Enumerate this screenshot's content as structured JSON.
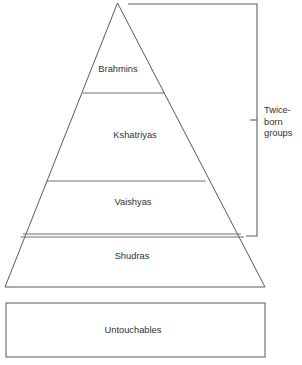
{
  "diagram": {
    "type": "pyramid-hierarchy",
    "title": "",
    "background_color": "#ffffff",
    "line_color": "#555a5e",
    "text_color": "#2f3234",
    "pyramid": {
      "name": "caste-pyramid",
      "apex": {
        "x": 117.5,
        "y": 3
      },
      "base_left": {
        "x": 5,
        "y": 287
      },
      "base_right": {
        "x": 265,
        "y": 287
      },
      "tiers": [
        {
          "id": "brahmins",
          "label": "Brahmins",
          "label_x": 118,
          "label_y": 70,
          "divider_y": 93,
          "divider_x1": 83,
          "divider_x2": 165
        },
        {
          "id": "kshatriyas",
          "label": "Kshatriyas",
          "label_x": 135,
          "label_y": 136,
          "divider_y": 181,
          "divider_x1": 46.5,
          "divider_x2": 205.5
        },
        {
          "id": "vaishyas",
          "label": "Vaishyas",
          "label_x": 133,
          "label_y": 203,
          "divider_y": 234,
          "divider_x1": 23,
          "divider_x2": 241
        },
        {
          "id": "vaishyas-shudras-second-rule",
          "label": "",
          "divider_y": 237,
          "divider_x1": 20.5,
          "divider_x2": 244
        },
        {
          "id": "shudras",
          "label": "Shudras",
          "label_x": 132,
          "label_y": 257,
          "divider_y": null,
          "divider_x1": null,
          "divider_x2": null
        }
      ]
    },
    "bracket": {
      "name": "twice-born-bracket",
      "label_lines": [
        "Twice-",
        "born",
        "groups"
      ],
      "top_y": 4,
      "bottom_y": 236,
      "spine_x": 257,
      "top_x_start": 128,
      "bottom_x_start": 246,
      "tick_y": 120,
      "tick_x_start": 250,
      "label_x": 264,
      "label_y_start": 111,
      "label_line_height": 11.5
    },
    "outcast_box": {
      "name": "untouchables-box",
      "label": "Untouchables",
      "x": 6,
      "y": 303,
      "width": 259,
      "height": 54,
      "label_x": 133,
      "label_y": 331
    }
  }
}
